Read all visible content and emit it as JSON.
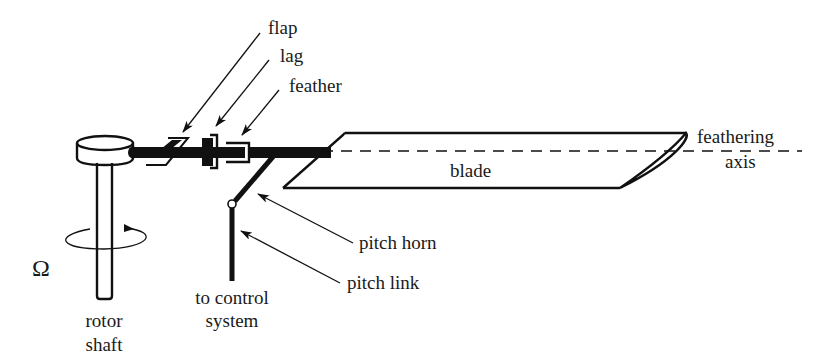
{
  "diagram": {
    "title": "",
    "type": "rotor hub hinge arrangement",
    "colors": {
      "ink": "#111111",
      "background": "#ffffff"
    },
    "components": {
      "hub": "rotor hub",
      "shaft": "rotor shaft",
      "hinges": [
        "flap",
        "lag",
        "feather"
      ],
      "blade": "blade",
      "axis": "feathering axis",
      "horn": "pitch horn",
      "link": "pitch link"
    },
    "labels": {
      "flap": "flap",
      "lag": "lag",
      "feather": "feather",
      "blade": "blade",
      "feathering_line1": "feathering",
      "feathering_line2": "axis",
      "pitch_horn": "pitch horn",
      "pitch_link": "pitch link",
      "control_line1": "to control",
      "control_line2": "system",
      "shaft_line1": "rotor",
      "shaft_line2": "shaft",
      "omega": "Ω"
    }
  }
}
